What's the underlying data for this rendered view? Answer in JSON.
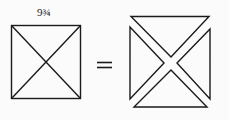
{
  "diagram": {
    "dimension_label": "9¾",
    "left_figure": "square with both diagonals",
    "operator": "=",
    "right_figure": "four separated triangles",
    "stroke_color": "#1a1a1a",
    "background": "#fbfbfb"
  }
}
